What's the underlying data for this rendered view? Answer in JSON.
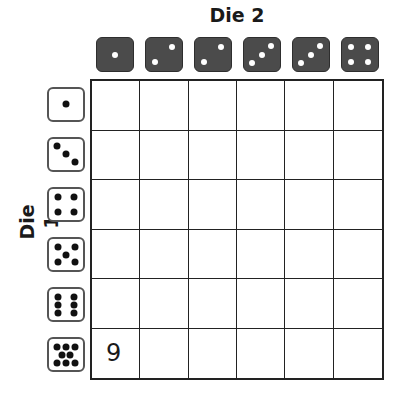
{
  "labels": {
    "top": "Die 2",
    "left": "Die 1"
  },
  "colors": {
    "top_die_fill": "#4b4b4b",
    "top_die_pip": "#ffffff",
    "left_die_fill": "#ffffff",
    "left_die_border": "#555555",
    "left_die_pip": "#111111",
    "grid_line": "#222222"
  },
  "top_dice": [
    {
      "value": 1,
      "icon": "die-face-1-icon"
    },
    {
      "value": 2,
      "icon": "die-face-2-icon"
    },
    {
      "value": 2,
      "icon": "die-face-2-icon"
    },
    {
      "value": 3,
      "icon": "die-face-3-icon"
    },
    {
      "value": 3,
      "icon": "die-face-3-icon"
    },
    {
      "value": 4,
      "icon": "die-face-4-icon"
    }
  ],
  "left_dice": [
    {
      "value": 1,
      "icon": "die-face-1-icon"
    },
    {
      "value": 3,
      "icon": "die-face-3-icon"
    },
    {
      "value": 4,
      "icon": "die-face-4-icon"
    },
    {
      "value": 5,
      "icon": "die-face-5-icon"
    },
    {
      "value": 6,
      "icon": "die-face-6-icon"
    },
    {
      "value": 8,
      "icon": "die-face-8-icon"
    }
  ],
  "grid": {
    "rows": 6,
    "cols": 6,
    "cells": [
      [
        "",
        "",
        "",
        "",
        "",
        ""
      ],
      [
        "",
        "",
        "",
        "",
        "",
        ""
      ],
      [
        "",
        "",
        "",
        "",
        "",
        ""
      ],
      [
        "",
        "",
        "",
        "",
        "",
        ""
      ],
      [
        "",
        "",
        "",
        "",
        "",
        ""
      ],
      [
        "9",
        "",
        "",
        "",
        "",
        ""
      ]
    ]
  }
}
